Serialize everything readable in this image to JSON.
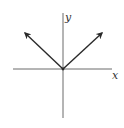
{
  "diagram": {
    "type": "function-graph",
    "function": "y = |x|",
    "axes": {
      "x_label": "x",
      "y_label": "y"
    },
    "colors": {
      "axis": "#6b6b6b",
      "curve": "#2a2a2a",
      "background": "#ffffff"
    },
    "geometry": {
      "origin": [
        63,
        69
      ],
      "x_axis": [
        13,
        112
      ],
      "y_axis": [
        13,
        118
      ],
      "left_arrow_tip": [
        24,
        32
      ],
      "right_arrow_tip": [
        103,
        32
      ]
    }
  }
}
